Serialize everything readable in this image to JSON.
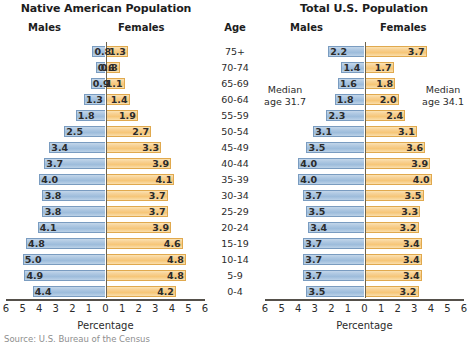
{
  "source_note": "Source: U.S. Bureau of the Census",
  "age_header": "Age",
  "colors": {
    "male_bar": "#a8c4e0",
    "male_border": "#7a9cc0",
    "female_bar": "#f6c678",
    "female_border": "#e0a94e",
    "center_line": "#6b6350",
    "axis": "#55504a",
    "text": "#2b2b2b"
  },
  "axis": {
    "title": "Percentage",
    "ticks": [
      "6",
      "5",
      "4",
      "3",
      "2",
      "1",
      "0",
      "1",
      "2",
      "3",
      "4",
      "5",
      "6"
    ],
    "min": -6,
    "max": 6
  },
  "age_groups": [
    "75+",
    "70-74",
    "65-69",
    "60-64",
    "55-59",
    "50-54",
    "45-49",
    "40-44",
    "35-39",
    "30-34",
    "25-29",
    "20-24",
    "15-19",
    "10-14",
    "5-9",
    "0-4"
  ],
  "panels": [
    {
      "id": "native",
      "title": "Native American Population",
      "males_label": "Males",
      "females_label": "Females",
      "males": [
        0.8,
        0.6,
        0.9,
        1.3,
        1.8,
        2.5,
        3.4,
        3.7,
        4.0,
        3.8,
        3.8,
        4.1,
        4.8,
        5.0,
        4.9,
        4.4
      ],
      "females": [
        1.3,
        0.8,
        1.1,
        1.4,
        1.9,
        2.7,
        3.3,
        3.9,
        4.1,
        3.7,
        3.7,
        3.9,
        4.6,
        4.8,
        4.8,
        4.2
      ],
      "males_text": [
        "0.8",
        "0.6",
        "0.9",
        "1.3",
        "1.8",
        "2.5",
        "3.4",
        "3.7",
        "4.0",
        "3.8",
        "3.8",
        "4.1",
        "4.8",
        "5.0",
        "4.9",
        "4.4"
      ],
      "females_text": [
        "1.3",
        "0.8",
        "1.1",
        "1.4",
        "1.9",
        "2.7",
        "3.3",
        "3.9",
        "4.1",
        "3.7",
        "3.7",
        "3.9",
        "4.6",
        "4.8",
        "4.8",
        "4.2"
      ]
    },
    {
      "id": "total",
      "title": "Total U.S. Population",
      "males_label": "Males",
      "females_label": "Females",
      "males": [
        2.2,
        1.4,
        1.6,
        1.8,
        2.3,
        3.1,
        3.5,
        4.0,
        4.0,
        3.7,
        3.5,
        3.4,
        3.7,
        3.7,
        3.7,
        3.5
      ],
      "females": [
        3.7,
        1.7,
        1.8,
        2.0,
        2.4,
        3.1,
        3.6,
        3.9,
        4.0,
        3.5,
        3.3,
        3.2,
        3.4,
        3.4,
        3.4,
        3.2
      ],
      "males_text": [
        "2.2",
        "1.4",
        "1.6",
        "1.8",
        "2.3",
        "3.1",
        "3.5",
        "4.0",
        "4.0",
        "3.7",
        "3.5",
        "3.4",
        "3.7",
        "3.7",
        "3.7",
        "3.5"
      ],
      "females_text": [
        "3.7",
        "1.7",
        "1.8",
        "2.0",
        "2.4",
        "3.1",
        "3.6",
        "3.9",
        "4.0",
        "3.5",
        "3.3",
        "3.2",
        "3.4",
        "3.4",
        "3.4",
        "3.2"
      ],
      "median_male_line1": "Median",
      "median_male_line2": "age 31.7",
      "median_female_line1": "Median",
      "median_female_line2": "age 34.1"
    }
  ],
  "chart_data": {
    "type": "bar",
    "subtype": "population-pyramid",
    "xlabel": "Percentage",
    "ylabel": "Age",
    "xlim": [
      -6,
      6
    ],
    "grid": false,
    "legend_position": "top (Males left / Females right)",
    "categories": [
      "75+",
      "70-74",
      "65-69",
      "60-64",
      "55-59",
      "50-54",
      "45-49",
      "40-44",
      "35-39",
      "30-34",
      "25-29",
      "20-24",
      "15-19",
      "10-14",
      "5-9",
      "0-4"
    ],
    "panels": [
      {
        "name": "Native American Population",
        "series": [
          {
            "name": "Males",
            "values": [
              0.8,
              0.6,
              0.9,
              1.3,
              1.8,
              2.5,
              3.4,
              3.7,
              4.0,
              3.8,
              3.8,
              4.1,
              4.8,
              5.0,
              4.9,
              4.4
            ]
          },
          {
            "name": "Females",
            "values": [
              1.3,
              0.8,
              1.1,
              1.4,
              1.9,
              2.7,
              3.3,
              3.9,
              4.1,
              3.7,
              3.7,
              3.9,
              4.6,
              4.8,
              4.8,
              4.2
            ]
          }
        ]
      },
      {
        "name": "Total U.S. Population",
        "series": [
          {
            "name": "Males",
            "values": [
              2.2,
              1.4,
              1.6,
              1.8,
              2.3,
              3.1,
              3.5,
              4.0,
              4.0,
              3.7,
              3.5,
              3.4,
              3.7,
              3.7,
              3.7,
              3.5
            ]
          },
          {
            "name": "Females",
            "values": [
              3.7,
              1.7,
              1.8,
              2.0,
              2.4,
              3.1,
              3.6,
              3.9,
              4.0,
              3.5,
              3.3,
              3.2,
              3.4,
              3.4,
              3.4,
              3.2
            ]
          }
        ],
        "annotations": [
          {
            "text": "Median age 31.7",
            "side": "males"
          },
          {
            "text": "Median age 34.1",
            "side": "females"
          }
        ]
      }
    ],
    "source": "Source: U.S. Bureau of the Census"
  }
}
